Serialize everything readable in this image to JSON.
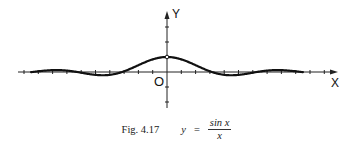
{
  "chart_data": {
    "type": "line",
    "function": "sin(x)/x",
    "xlabel": "X",
    "ylabel": "Y",
    "origin_label": "O",
    "xlim": [
      -10.3,
      10.3
    ],
    "ylim": [
      -2.5,
      4.2
    ],
    "grid": false,
    "legend": null,
    "annotations": [
      "open circle at (0, 1) — point undefined at x = 0"
    ],
    "x": [
      -10,
      -9,
      -8,
      -7,
      -6,
      -5,
      -4,
      -3,
      -2,
      -1,
      0,
      1,
      2,
      3,
      4,
      5,
      6,
      7,
      8,
      9,
      10
    ],
    "values": [
      -0.054,
      0.046,
      0.124,
      0.094,
      -0.047,
      -0.192,
      -0.189,
      0.047,
      0.455,
      0.841,
      1.0,
      0.841,
      0.455,
      0.047,
      -0.189,
      -0.192,
      -0.047,
      0.094,
      0.124,
      0.046,
      -0.054
    ],
    "colors": {
      "curve": "#111111",
      "axes": "#222222"
    }
  },
  "caption": {
    "fig": "Fig. 4.17",
    "lhs": "y",
    "eq": "=",
    "numerator": "sin x",
    "denominator": "x"
  },
  "axes": {
    "x_label": "X",
    "y_label": "Y",
    "origin": "O"
  }
}
